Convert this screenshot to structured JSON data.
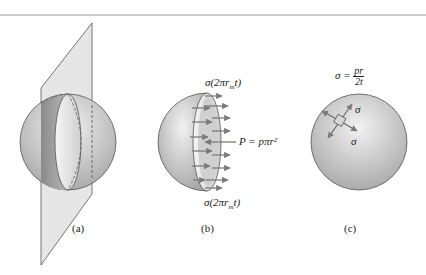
{
  "figure": {
    "panels": [
      {
        "id": "a",
        "caption": "(a)",
        "description": "Sphere cut by inclined plane"
      },
      {
        "id": "b",
        "caption": "(b)",
        "description": "Hemisphere free-body with internal pressure and wall stress"
      },
      {
        "id": "c",
        "caption": "(c)",
        "description": "Sphere with biaxial stress element"
      }
    ],
    "labels": {
      "b_top_force": "σ(2πr_m t)",
      "b_bottom_force": "σ(2πr_m t)",
      "b_pressure_force": "P = pπr²",
      "c_formula_lhs": "σ =",
      "c_formula_num": "pr",
      "c_formula_den": "2t",
      "c_sigma_top": "σ",
      "c_sigma_bottom": "σ"
    },
    "colors": {
      "sphere_light": "#eeeeee",
      "sphere_dark": "#a8a8a8",
      "plane": "#e2e2e2",
      "arrow": "#7a7a7a",
      "outline": "#555555",
      "top_rule": "#bbbbbb"
    }
  }
}
